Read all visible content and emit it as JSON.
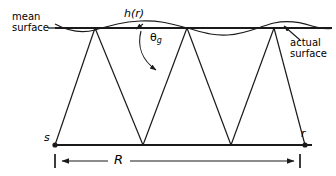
{
  "figure": {
    "type": "ray-path-rough-surface-scattering-diagram",
    "background_color": "#ffffff",
    "stroke_color": "#1a1a1a",
    "labels": {
      "mean_surface": "mean\nsurface",
      "actual_surface": "actual\nsurface",
      "height_function": "h(r)",
      "grazing_angle": "θ",
      "grazing_angle_subscript": "g",
      "source": "s",
      "receiver": "r",
      "range": "R"
    },
    "geometry": {
      "mean_surface_line": {
        "y": 28,
        "x_start": 55,
        "x_end": 332
      },
      "ground_line": {
        "y": 145,
        "x_start": 55,
        "x_end": 312
      },
      "source_point": {
        "x": 55,
        "y": 145
      },
      "receiver_point": {
        "x": 305,
        "y": 145
      },
      "top_vertices_x": [
        95,
        187,
        274
      ],
      "bottom_vertices_x": [
        143,
        231
      ],
      "dimension_line": {
        "y": 161,
        "x_start": 55,
        "x_end": 300
      },
      "actual_surface_arrow_tip": {
        "x": 284,
        "y": 26
      },
      "hr_arrow_tip": {
        "x": 136,
        "y": 29
      }
    },
    "wave": {
      "description": "sinusoidal actual surface oscillating about the mean surface line",
      "amplitude_px": 6,
      "wavelength_px": 92,
      "x_start": 55,
      "x_end": 332
    }
  }
}
